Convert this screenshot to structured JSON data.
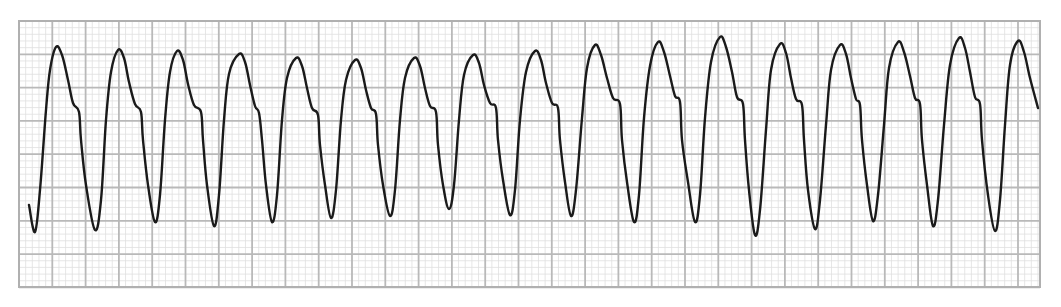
{
  "chart_data": {
    "type": "line",
    "title": "",
    "subtitle": "ECG rhythm strip (regular wide-complex tachycardia)",
    "xlabel": "",
    "ylabel": "",
    "grid": true,
    "legend": "none",
    "paper": {
      "left": 19,
      "top": 21,
      "right": 1040,
      "bottom": 287,
      "major_px": 33.3,
      "minor_per_major": 5,
      "major_color": "#b9b9b9",
      "minor_color": "#e0e0e0",
      "border_color": "#b0b0b0"
    },
    "trace_color": "#1a1a1a",
    "complex_count": 17,
    "series": [
      {
        "name": "ECG lead",
        "points": [
          [
            29,
            205
          ],
          [
            35,
            232
          ],
          [
            40,
            190
          ],
          [
            46,
            110
          ],
          [
            50,
            70
          ],
          [
            56,
            47
          ],
          [
            62,
            55
          ],
          [
            68,
            80
          ],
          [
            73,
            103
          ],
          [
            79,
            112
          ],
          [
            81,
            140
          ],
          [
            86,
            185
          ],
          [
            95,
            230
          ],
          [
            101,
            200
          ],
          [
            106,
            120
          ],
          [
            111,
            72
          ],
          [
            118,
            50
          ],
          [
            124,
            58
          ],
          [
            129,
            82
          ],
          [
            135,
            104
          ],
          [
            141,
            112
          ],
          [
            143,
            140
          ],
          [
            148,
            185
          ],
          [
            155,
            222
          ],
          [
            160,
            195
          ],
          [
            165,
            120
          ],
          [
            170,
            72
          ],
          [
            177,
            51
          ],
          [
            183,
            60
          ],
          [
            188,
            84
          ],
          [
            194,
            105
          ],
          [
            201,
            112
          ],
          [
            203,
            140
          ],
          [
            207,
            185
          ],
          [
            214,
            226
          ],
          [
            219,
            195
          ],
          [
            224,
            120
          ],
          [
            229,
            74
          ],
          [
            239,
            54
          ],
          [
            245,
            62
          ],
          [
            250,
            85
          ],
          [
            255,
            106
          ],
          [
            259,
            113
          ],
          [
            262,
            140
          ],
          [
            266,
            185
          ],
          [
            272,
            222
          ],
          [
            277,
            195
          ],
          [
            282,
            120
          ],
          [
            287,
            78
          ],
          [
            296,
            58
          ],
          [
            302,
            66
          ],
          [
            307,
            88
          ],
          [
            312,
            108
          ],
          [
            318,
            115
          ],
          [
            320,
            145
          ],
          [
            325,
            185
          ],
          [
            331,
            218
          ],
          [
            336,
            190
          ],
          [
            341,
            120
          ],
          [
            346,
            80
          ],
          [
            355,
            60
          ],
          [
            361,
            68
          ],
          [
            366,
            90
          ],
          [
            371,
            108
          ],
          [
            376,
            114
          ],
          [
            378,
            145
          ],
          [
            383,
            185
          ],
          [
            390,
            216
          ],
          [
            395,
            190
          ],
          [
            400,
            120
          ],
          [
            405,
            78
          ],
          [
            414,
            58
          ],
          [
            420,
            66
          ],
          [
            425,
            88
          ],
          [
            430,
            106
          ],
          [
            436,
            112
          ],
          [
            438,
            145
          ],
          [
            443,
            185
          ],
          [
            449,
            209
          ],
          [
            454,
            185
          ],
          [
            459,
            120
          ],
          [
            464,
            75
          ],
          [
            473,
            55
          ],
          [
            479,
            63
          ],
          [
            484,
            85
          ],
          [
            490,
            103
          ],
          [
            496,
            108
          ],
          [
            498,
            140
          ],
          [
            503,
            180
          ],
          [
            510,
            215
          ],
          [
            515,
            190
          ],
          [
            520,
            120
          ],
          [
            526,
            72
          ],
          [
            535,
            51
          ],
          [
            541,
            60
          ],
          [
            546,
            83
          ],
          [
            552,
            103
          ],
          [
            558,
            108
          ],
          [
            560,
            140
          ],
          [
            565,
            182
          ],
          [
            571,
            216
          ],
          [
            576,
            190
          ],
          [
            582,
            118
          ],
          [
            587,
            68
          ],
          [
            595,
            45
          ],
          [
            601,
            55
          ],
          [
            607,
            78
          ],
          [
            613,
            98
          ],
          [
            620,
            104
          ],
          [
            622,
            140
          ],
          [
            627,
            182
          ],
          [
            634,
            222
          ],
          [
            639,
            195
          ],
          [
            644,
            118
          ],
          [
            650,
            66
          ],
          [
            658,
            42
          ],
          [
            664,
            52
          ],
          [
            670,
            76
          ],
          [
            675,
            96
          ],
          [
            680,
            102
          ],
          [
            682,
            140
          ],
          [
            688,
            182
          ],
          [
            695,
            222
          ],
          [
            700,
            195
          ],
          [
            705,
            118
          ],
          [
            711,
            62
          ],
          [
            720,
            37
          ],
          [
            726,
            47
          ],
          [
            732,
            72
          ],
          [
            737,
            97
          ],
          [
            743,
            104
          ],
          [
            745,
            140
          ],
          [
            749,
            190
          ],
          [
            755,
            235
          ],
          [
            760,
            210
          ],
          [
            766,
            130
          ],
          [
            771,
            70
          ],
          [
            780,
            44
          ],
          [
            786,
            53
          ],
          [
            791,
            78
          ],
          [
            796,
            99
          ],
          [
            802,
            105
          ],
          [
            804,
            140
          ],
          [
            808,
            190
          ],
          [
            815,
            229
          ],
          [
            820,
            200
          ],
          [
            826,
            125
          ],
          [
            831,
            70
          ],
          [
            840,
            45
          ],
          [
            846,
            54
          ],
          [
            851,
            78
          ],
          [
            856,
            99
          ],
          [
            860,
            105
          ],
          [
            862,
            140
          ],
          [
            867,
            185
          ],
          [
            873,
            221
          ],
          [
            878,
            195
          ],
          [
            884,
            125
          ],
          [
            889,
            68
          ],
          [
            898,
            42
          ],
          [
            904,
            52
          ],
          [
            910,
            76
          ],
          [
            915,
            98
          ],
          [
            920,
            104
          ],
          [
            922,
            140
          ],
          [
            927,
            185
          ],
          [
            933,
            226
          ],
          [
            938,
            200
          ],
          [
            944,
            125
          ],
          [
            950,
            65
          ],
          [
            959,
            38
          ],
          [
            965,
            48
          ],
          [
            970,
            72
          ],
          [
            975,
            97
          ],
          [
            980,
            104
          ],
          [
            982,
            140
          ],
          [
            988,
            195
          ],
          [
            995,
            231
          ],
          [
            1000,
            200
          ],
          [
            1005,
            125
          ],
          [
            1010,
            65
          ],
          [
            1018,
            41
          ],
          [
            1024,
            52
          ],
          [
            1030,
            78
          ],
          [
            1038,
            108
          ]
        ]
      }
    ]
  }
}
